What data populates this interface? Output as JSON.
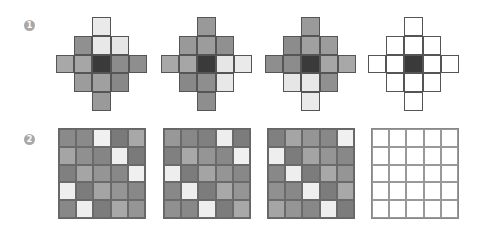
{
  "rows": [
    {
      "label": "1",
      "badge_pos": [
        24,
        20
      ]
    },
    {
      "label": "2",
      "badge_pos": [
        24,
        134
      ]
    }
  ],
  "diamond_mask": [
    [
      0,
      0,
      1,
      0,
      0
    ],
    [
      0,
      1,
      1,
      1,
      0
    ],
    [
      1,
      1,
      1,
      1,
      1
    ],
    [
      0,
      1,
      1,
      1,
      0
    ],
    [
      0,
      0,
      1,
      0,
      0
    ]
  ],
  "diamonds": [
    {
      "x": 56,
      "y": 17,
      "cells": [
        [
          null,
          null,
          "#eaeaea",
          null,
          null
        ],
        [
          null,
          "#909090",
          "#e8e8e8",
          "#e6e6e6",
          null
        ],
        [
          "#a8a8a8",
          "#a6a6a6",
          "#3a3a3a",
          "#8c8c8c",
          "#8e8e8e"
        ],
        [
          null,
          "#9c9c9c",
          "#a0a0a0",
          "#888888",
          null
        ],
        [
          null,
          null,
          "#9a9a9a",
          null,
          null
        ]
      ]
    },
    {
      "x": 161,
      "y": 17,
      "cells": [
        [
          null,
          null,
          "#999999",
          null,
          null
        ],
        [
          null,
          "#999999",
          "#9c9c9c",
          "#909090",
          null
        ],
        [
          "#a8a8a8",
          "#a6a6a6",
          "#3a3a3a",
          "#e6e6e6",
          "#eaeaea"
        ],
        [
          null,
          "#888888",
          "#8e8e8e",
          "#e8e8e8",
          null
        ],
        [
          null,
          null,
          "#8e8e8e",
          null,
          null
        ]
      ]
    },
    {
      "x": 265,
      "y": 17,
      "cells": [
        [
          null,
          null,
          "#9a9a9a",
          null,
          null
        ],
        [
          null,
          "#8c8c8c",
          "#a0a0a0",
          "#9c9c9c",
          null
        ],
        [
          "#8e8e8e",
          "#8c8c8c",
          "#3a3a3a",
          "#a6a6a6",
          "#a8a8a8"
        ],
        [
          null,
          "#e6e6e6",
          "#e8e8e8",
          "#909090",
          null
        ],
        [
          null,
          null,
          "#eaeaea",
          null,
          null
        ]
      ]
    },
    {
      "x": 368,
      "y": 17,
      "cells": [
        [
          null,
          null,
          "#ffffff",
          null,
          null
        ],
        [
          null,
          "#ffffff",
          "#ffffff",
          "#ffffff",
          null
        ],
        [
          "#ffffff",
          "#ffffff",
          "#3a3a3a",
          "#ffffff",
          "#ffffff"
        ],
        [
          null,
          "#ffffff",
          "#ffffff",
          "#ffffff",
          null
        ],
        [
          null,
          null,
          "#ffffff",
          null,
          null
        ]
      ]
    }
  ],
  "grids": [
    {
      "x": 58,
      "y": 128,
      "cells": [
        [
          "#8a8a8a",
          "#8a8a8a",
          "#f0f0f0",
          "#7a7a7a",
          "#a8a8a8"
        ],
        [
          "#a5a5a5",
          "#909090",
          "#858585",
          "#efefef",
          "#7a7a7a"
        ],
        [
          "#808080",
          "#a5a5a5",
          "#959595",
          "#888888",
          "#f0f0f0"
        ],
        [
          "#eeeeee",
          "#7c7c7c",
          "#a4a4a4",
          "#959595",
          "#888888"
        ],
        [
          "#888888",
          "#eeeeee",
          "#7c7c7c",
          "#a8a8a8",
          "#959595"
        ]
      ]
    },
    {
      "x": 163,
      "y": 128,
      "cells": [
        [
          "#989898",
          "#888888",
          "#808080",
          "#eeeeee",
          "#7c7c7c"
        ],
        [
          "#808080",
          "#a8a8a8",
          "#959595",
          "#888888",
          "#f0f0f0"
        ],
        [
          "#eeeeee",
          "#7c7c7c",
          "#a4a4a4",
          "#959595",
          "#888888"
        ],
        [
          "#888888",
          "#eeeeee",
          "#7c7c7c",
          "#a8a8a8",
          "#959595"
        ],
        [
          "#909090",
          "#888888",
          "#eeeeee",
          "#7c7c7c",
          "#a8a8a8"
        ]
      ]
    },
    {
      "x": 267,
      "y": 128,
      "cells": [
        [
          "#808080",
          "#a5a5a5",
          "#959595",
          "#888888",
          "#f0f0f0"
        ],
        [
          "#eeeeee",
          "#7c7c7c",
          "#a4a4a4",
          "#959595",
          "#888888"
        ],
        [
          "#888888",
          "#eeeeee",
          "#7c7c7c",
          "#a8a8a8",
          "#959595"
        ],
        [
          "#909090",
          "#888888",
          "#eeeeee",
          "#7c7c7c",
          "#a8a8a8"
        ],
        [
          "#a5a5a5",
          "#959595",
          "#888888",
          "#eeeeee",
          "#7c7c7c"
        ]
      ]
    },
    {
      "x": 371,
      "y": 128,
      "empty": true
    }
  ]
}
